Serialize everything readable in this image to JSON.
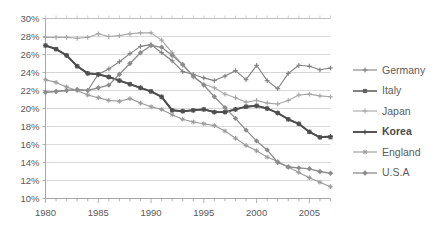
{
  "chart_data": {
    "type": "line",
    "title": "",
    "subtitle": "",
    "xlabel": "",
    "ylabel": "",
    "xlim": [
      1980,
      2007
    ],
    "ylim": [
      10,
      30
    ],
    "ytick_labels": [
      "30%",
      "28%",
      "26%",
      "24%",
      "22%",
      "20%",
      "18%",
      "16%",
      "14%",
      "12%",
      "10%"
    ],
    "ytick_values": [
      30,
      28,
      26,
      24,
      22,
      20,
      18,
      16,
      14,
      12,
      10
    ],
    "xtick_labels": [
      "1980",
      "1985",
      "1990",
      "1995",
      "2000",
      "2005"
    ],
    "xtick_values": [
      1980,
      1985,
      1990,
      1995,
      2000,
      2005
    ],
    "grid": "horizontal",
    "legend_position": "right",
    "x": [
      1980,
      1981,
      1982,
      1983,
      1984,
      1985,
      1986,
      1987,
      1988,
      1989,
      1990,
      1991,
      1992,
      1993,
      1994,
      1995,
      1996,
      1997,
      1998,
      1999,
      2000,
      2001,
      2002,
      2003,
      2004,
      2005,
      2006,
      2007
    ],
    "series": [
      {
        "name": "Germany",
        "color": "#808080",
        "marker": "plus",
        "width": 1.1,
        "values": [
          21.8,
          21.9,
          22.0,
          22.1,
          22.0,
          23.8,
          24.4,
          25.2,
          26.1,
          26.9,
          27.1,
          26.2,
          25.3,
          24.1,
          23.8,
          23.4,
          23.1,
          23.6,
          24.2,
          23.2,
          24.8,
          23.1,
          22.2,
          23.9,
          24.8,
          24.7,
          24.3,
          24.5
        ]
      },
      {
        "name": "Italy",
        "color": "#636363",
        "marker": "square",
        "width": 1.6,
        "values": [
          27.0,
          26.6,
          25.9,
          24.7,
          23.9,
          23.8,
          23.5,
          23.1,
          22.7,
          22.3,
          21.9,
          21.3,
          19.8,
          19.7,
          19.8,
          19.9,
          19.6,
          19.6,
          19.9,
          20.2,
          20.3,
          20.0,
          19.5,
          18.8,
          18.3,
          17.4,
          16.8,
          16.8
        ]
      },
      {
        "name": "Japan",
        "color": "#a6a6a6",
        "marker": "plus",
        "width": 1.1,
        "values": [
          27.9,
          27.9,
          27.9,
          27.8,
          27.9,
          28.3,
          28.0,
          28.1,
          28.3,
          28.4,
          28.4,
          27.6,
          26.2,
          24.8,
          23.5,
          22.7,
          22.3,
          21.6,
          21.2,
          20.7,
          20.9,
          20.6,
          20.5,
          20.9,
          21.5,
          21.6,
          21.4,
          21.3
        ]
      },
      {
        "name": "Korea",
        "color": "#4d4d4d",
        "marker": "plus",
        "width": 1.9,
        "values": [
          27.0,
          26.6,
          25.9,
          24.7,
          23.9,
          23.8,
          23.5,
          23.1,
          22.7,
          22.3,
          21.9,
          21.3,
          19.8,
          19.7,
          19.8,
          19.9,
          19.6,
          19.6,
          19.9,
          20.2,
          20.3,
          20.0,
          19.5,
          18.8,
          18.3,
          17.4,
          16.8,
          16.9
        ]
      },
      {
        "name": "England",
        "color": "#999999",
        "marker": "star",
        "width": 1.1,
        "values": [
          23.2,
          22.9,
          22.4,
          22.0,
          21.5,
          21.2,
          20.9,
          20.8,
          21.1,
          20.6,
          20.2,
          19.9,
          19.3,
          18.8,
          18.5,
          18.3,
          18.1,
          17.5,
          16.7,
          15.9,
          15.3,
          14.6,
          14.1,
          13.5,
          12.9,
          12.3,
          11.8,
          11.3
        ]
      },
      {
        "name": "U.S.A",
        "color": "#8c8c8c",
        "marker": "diamond",
        "width": 1.3,
        "values": [
          21.8,
          21.9,
          22.0,
          22.1,
          22.0,
          22.3,
          22.6,
          23.8,
          25.0,
          26.2,
          27.0,
          26.8,
          25.9,
          24.9,
          23.6,
          22.6,
          21.3,
          20.1,
          18.9,
          17.6,
          16.4,
          15.4,
          14.0,
          13.5,
          13.4,
          13.3,
          13.0,
          12.8
        ]
      }
    ]
  },
  "legend": {
    "items": [
      {
        "label": "Germany",
        "marker": "plus-marker",
        "bold": false
      },
      {
        "label": "Italy",
        "marker": "square-marker",
        "bold": false
      },
      {
        "label": "Japan",
        "marker": "plus-marker",
        "bold": false
      },
      {
        "label": "Korea",
        "marker": "plus-marker",
        "bold": true
      },
      {
        "label": "England",
        "marker": "star-marker",
        "bold": false
      },
      {
        "label": "U.S.A",
        "marker": "diamond-marker",
        "bold": false
      }
    ]
  },
  "axes": {
    "y_labels": [
      "30%",
      "28%",
      "26%",
      "24%",
      "22%",
      "20%",
      "18%",
      "16%",
      "14%",
      "12%",
      "10%"
    ],
    "x_labels": [
      "1980",
      "1985",
      "1990",
      "1995",
      "2000",
      "2005"
    ]
  }
}
